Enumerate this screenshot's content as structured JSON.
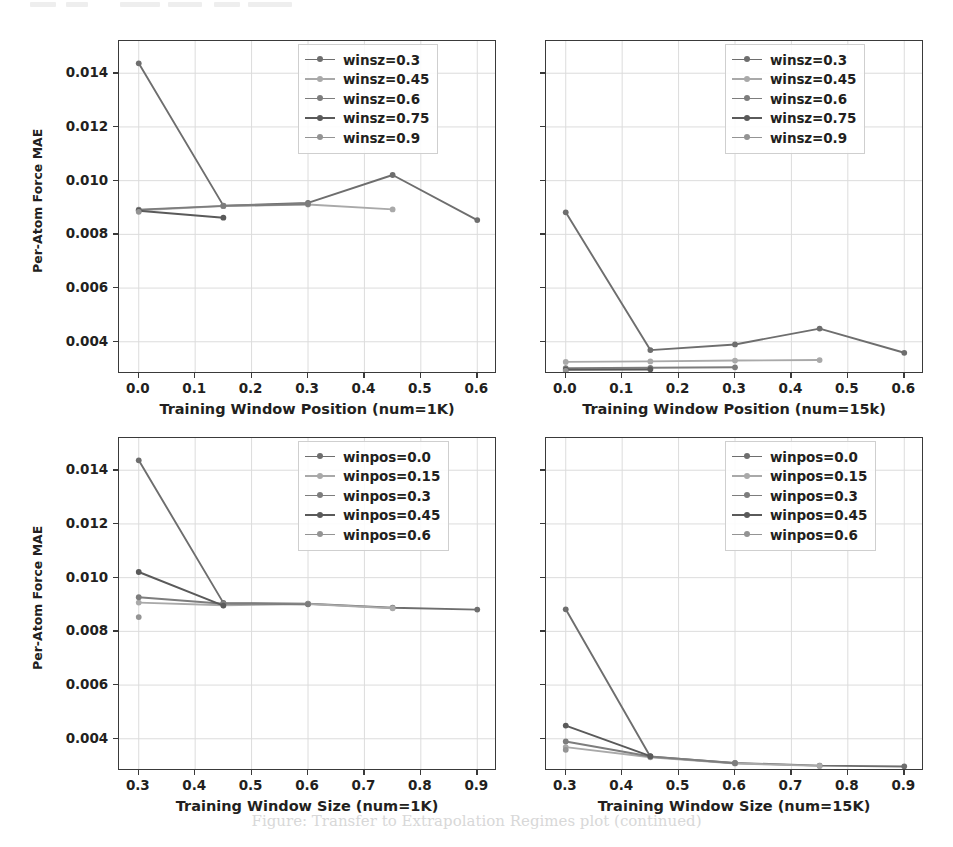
{
  "figure": {
    "caption": "Figure: Transfer to Extrapolation Regimes plot (continued)",
    "y_axis_label": "Per-Atom Force MAE",
    "series_colors": [
      "#6e6e6e",
      "#a9a9a9",
      "#7d7d7d",
      "#5a5a5a",
      "#949494"
    ],
    "grid": true,
    "legend_position": "upper right"
  },
  "chart_data": [
    {
      "id": "top-left",
      "type": "line",
      "title": "",
      "xlabel": "Training Window Position (num=1K)",
      "ylabel": "Per-Atom Force MAE",
      "xlim": [
        -0.035,
        0.635
      ],
      "ylim": [
        0.0028,
        0.0152
      ],
      "xticks": [
        0.0,
        0.1,
        0.2,
        0.3,
        0.4,
        0.5,
        0.6
      ],
      "xticklabels": [
        "0.0",
        "0.1",
        "0.2",
        "0.3",
        "0.4",
        "0.5",
        "0.6"
      ],
      "yticks": [
        0.004,
        0.006,
        0.008,
        0.01,
        0.012,
        0.014
      ],
      "yticklabels": [
        "0.004",
        "0.006",
        "0.008",
        "0.010",
        "0.012",
        "0.014"
      ],
      "grid": true,
      "legend": [
        "winsz=0.3",
        "winsz=0.45",
        "winsz=0.6",
        "winsz=0.75",
        "winsz=0.9"
      ],
      "series": [
        {
          "name": "winsz=0.3",
          "x": [
            0.0,
            0.15,
            0.3,
            0.45,
            0.6
          ],
          "values": [
            0.01437,
            0.00907,
            0.00917,
            0.01021,
            0.00853
          ]
        },
        {
          "name": "winsz=0.45",
          "x": [
            0.0,
            0.15,
            0.3,
            0.45
          ],
          "values": [
            0.0089,
            0.00905,
            0.00911,
            0.00893
          ]
        },
        {
          "name": "winsz=0.6",
          "x": [
            0.0,
            0.15,
            0.3
          ],
          "values": [
            0.00892,
            0.00906,
            0.00913
          ]
        },
        {
          "name": "winsz=0.75",
          "x": [
            0.0,
            0.15
          ],
          "values": [
            0.00888,
            0.00862
          ]
        },
        {
          "name": "winsz=0.9",
          "x": [
            0.0
          ],
          "values": [
            0.00884
          ]
        }
      ]
    },
    {
      "id": "top-right",
      "type": "line",
      "title": "",
      "xlabel": "Training Window Position (num=15k)",
      "ylabel": "",
      "xlim": [
        -0.035,
        0.635
      ],
      "ylim": [
        0.0028,
        0.0152
      ],
      "xticks": [
        0.0,
        0.1,
        0.2,
        0.3,
        0.4,
        0.5,
        0.6
      ],
      "xticklabels": [
        "0.0",
        "0.1",
        "0.2",
        "0.3",
        "0.4",
        "0.5",
        "0.6"
      ],
      "yticks": [
        0.004,
        0.006,
        0.008,
        0.01,
        0.012,
        0.014
      ],
      "yticklabels": [],
      "grid": true,
      "legend": [
        "winsz=0.3",
        "winsz=0.45",
        "winsz=0.6",
        "winsz=0.75",
        "winsz=0.9"
      ],
      "series": [
        {
          "name": "winsz=0.3",
          "x": [
            0.0,
            0.15,
            0.3,
            0.45,
            0.6
          ],
          "values": [
            0.00882,
            0.00369,
            0.0039,
            0.00449,
            0.00359
          ]
        },
        {
          "name": "winsz=0.45",
          "x": [
            0.0,
            0.15,
            0.3,
            0.45
          ],
          "values": [
            0.00325,
            0.00327,
            0.0033,
            0.00332
          ]
        },
        {
          "name": "winsz=0.6",
          "x": [
            0.0,
            0.15,
            0.3
          ],
          "values": [
            0.00302,
            0.00303,
            0.00305
          ]
        },
        {
          "name": "winsz=0.75",
          "x": [
            0.0,
            0.15
          ],
          "values": [
            0.00296,
            0.00297
          ]
        },
        {
          "name": "winsz=0.9",
          "x": [
            0.0
          ],
          "values": [
            0.00292
          ]
        }
      ]
    },
    {
      "id": "bottom-left",
      "type": "line",
      "title": "",
      "xlabel": "Training Window Size (num=1K)",
      "ylabel": "Per-Atom Force MAE",
      "xlim": [
        0.265,
        0.935
      ],
      "ylim": [
        0.0028,
        0.0152
      ],
      "xticks": [
        0.3,
        0.4,
        0.5,
        0.6,
        0.7,
        0.8,
        0.9
      ],
      "xticklabels": [
        "0.3",
        "0.4",
        "0.5",
        "0.6",
        "0.7",
        "0.8",
        "0.9"
      ],
      "yticks": [
        0.004,
        0.006,
        0.008,
        0.01,
        0.012,
        0.014
      ],
      "yticklabels": [
        "0.004",
        "0.006",
        "0.008",
        "0.010",
        "0.012",
        "0.014"
      ],
      "grid": true,
      "legend": [
        "winpos=0.0",
        "winpos=0.15",
        "winpos=0.3",
        "winpos=0.45",
        "winpos=0.6"
      ],
      "series": [
        {
          "name": "winpos=0.0",
          "x": [
            0.3,
            0.45,
            0.6,
            0.75,
            0.9
          ],
          "values": [
            0.01437,
            0.00906,
            0.00903,
            0.00888,
            0.00881
          ]
        },
        {
          "name": "winpos=0.15",
          "x": [
            0.3,
            0.45,
            0.6,
            0.75
          ],
          "values": [
            0.00907,
            0.00897,
            0.00902,
            0.00886
          ]
        },
        {
          "name": "winpos=0.3",
          "x": [
            0.3,
            0.45,
            0.6
          ],
          "values": [
            0.00927,
            0.00903,
            0.00901
          ]
        },
        {
          "name": "winpos=0.45",
          "x": [
            0.3,
            0.45
          ],
          "values": [
            0.01021,
            0.00896
          ]
        },
        {
          "name": "winpos=0.6",
          "x": [
            0.3
          ],
          "values": [
            0.00853
          ]
        }
      ]
    },
    {
      "id": "bottom-right",
      "type": "line",
      "title": "",
      "xlabel": "Training Window Size (num=15K)",
      "ylabel": "",
      "xlim": [
        0.265,
        0.935
      ],
      "ylim": [
        0.0028,
        0.0152
      ],
      "xticks": [
        0.3,
        0.4,
        0.5,
        0.6,
        0.7,
        0.8,
        0.9
      ],
      "xticklabels": [
        "0.3",
        "0.4",
        "0.5",
        "0.6",
        "0.7",
        "0.8",
        "0.9"
      ],
      "yticks": [
        0.004,
        0.006,
        0.008,
        0.01,
        0.012,
        0.014
      ],
      "yticklabels": [],
      "grid": true,
      "legend": [
        "winpos=0.0",
        "winpos=0.15",
        "winpos=0.3",
        "winpos=0.45",
        "winpos=0.6"
      ],
      "series": [
        {
          "name": "winpos=0.0",
          "x": [
            0.3,
            0.45,
            0.6,
            0.75,
            0.9
          ],
          "values": [
            0.00882,
            0.00333,
            0.0031,
            0.003,
            0.00297
          ]
        },
        {
          "name": "winpos=0.15",
          "x": [
            0.3,
            0.45,
            0.6,
            0.75
          ],
          "values": [
            0.00369,
            0.00331,
            0.00308,
            0.00299
          ]
        },
        {
          "name": "winpos=0.3",
          "x": [
            0.3,
            0.45,
            0.6
          ],
          "values": [
            0.0039,
            0.00334,
            0.00309
          ]
        },
        {
          "name": "winpos=0.45",
          "x": [
            0.3,
            0.45
          ],
          "values": [
            0.00449,
            0.00335
          ]
        },
        {
          "name": "winpos=0.6",
          "x": [
            0.3
          ],
          "values": [
            0.00359
          ]
        }
      ]
    }
  ]
}
